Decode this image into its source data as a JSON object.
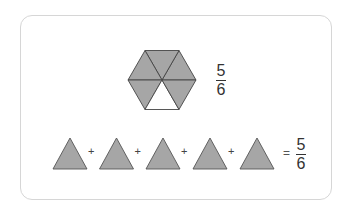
{
  "figure": {
    "hexagon": {
      "total_parts": 6,
      "shaded_parts": 5,
      "fill_color": "#a6a6a6",
      "empty_color": "#ffffff",
      "stroke_color": "#333333"
    },
    "hexagon_fraction": {
      "numerator": "5",
      "denominator": "6"
    },
    "equation": {
      "terms": [
        "triangle",
        "triangle",
        "triangle",
        "triangle",
        "triangle"
      ],
      "operator": "+",
      "equals": "=",
      "result": {
        "numerator": "5",
        "denominator": "6"
      }
    },
    "frame_color": "#d6d6d6"
  }
}
